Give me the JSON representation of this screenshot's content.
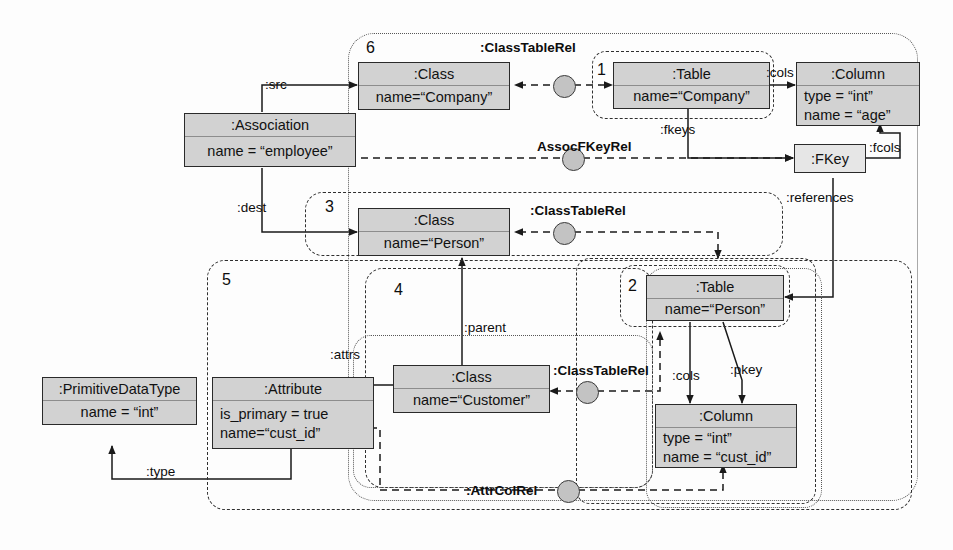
{
  "diagram": {
    "node_fill": "#d2d2d2",
    "corr_fill": "#c3c3c3",
    "line_color": "#2a2a2a"
  },
  "objects": [
    {
      "id": "class-company",
      "header": ":Class",
      "attrs": [
        "name=“Company”"
      ]
    },
    {
      "id": "association-employee",
      "header": ":Association",
      "attrs": [
        "name = “employee”"
      ]
    },
    {
      "id": "table-company",
      "header": ":Table",
      "attrs": [
        "name=“Company”"
      ]
    },
    {
      "id": "column-age",
      "header": ":Column",
      "attrs": [
        "type = “int”",
        "name = “age”"
      ]
    },
    {
      "id": "fkey",
      "header": ":FKey",
      "attrs": []
    },
    {
      "id": "class-person",
      "header": ":Class",
      "attrs": [
        "name=“Person”"
      ]
    },
    {
      "id": "table-person",
      "header": ":Table",
      "attrs": [
        "name=“Person”"
      ]
    },
    {
      "id": "primitive-int",
      "header": ":PrimitiveDataType",
      "attrs": [
        "name = “int”"
      ]
    },
    {
      "id": "attribute-cust-id",
      "header": ":Attribute",
      "attrs": [
        "is_primary = true",
        "name=“cust_id”"
      ]
    },
    {
      "id": "class-customer",
      "header": ":Class",
      "attrs": [
        "name=“Customer”"
      ]
    },
    {
      "id": "column-cust-id",
      "header": ":Column",
      "attrs": [
        "type = “int”",
        "name = “cust_id”"
      ]
    }
  ],
  "correspondences": [
    {
      "id": "corr-1",
      "label": ":ClassTableRel"
    },
    {
      "id": "corr-2",
      "label": "AssocFKeyRel"
    },
    {
      "id": "corr-3",
      "label": ":ClassTableRel"
    },
    {
      "id": "corr-4",
      "label": ":ClassTableRel"
    },
    {
      "id": "corr-5",
      "label": ":AttrColRel"
    }
  ],
  "edge_labels": [
    {
      "id": "src",
      "text": ":src"
    },
    {
      "id": "dest",
      "text": ":dest"
    },
    {
      "id": "cols-top",
      "text": ":cols"
    },
    {
      "id": "fkeys",
      "text": ":fkeys"
    },
    {
      "id": "fcols",
      "text": ":fcols"
    },
    {
      "id": "references",
      "text": ":references"
    },
    {
      "id": "parent",
      "text": ":parent"
    },
    {
      "id": "attrs",
      "text": ":attrs"
    },
    {
      "id": "type",
      "text": ":type"
    },
    {
      "id": "cols-bottom",
      "text": ":cols"
    },
    {
      "id": "pkey",
      "text": ":pkey"
    }
  ],
  "regions": [
    {
      "id": "region-6",
      "number": "6"
    },
    {
      "id": "region-1",
      "number": "1"
    },
    {
      "id": "region-3",
      "number": "3"
    },
    {
      "id": "region-2",
      "number": "2"
    },
    {
      "id": "region-5",
      "number": "5"
    },
    {
      "id": "region-4",
      "number": "4"
    }
  ]
}
